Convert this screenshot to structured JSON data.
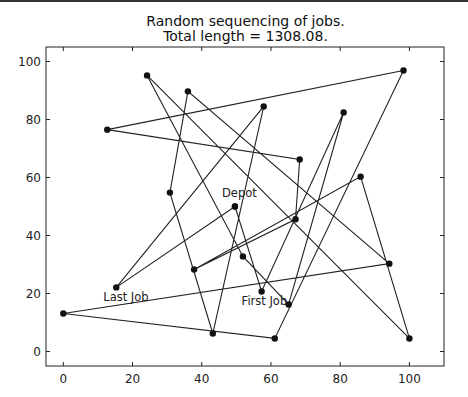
{
  "chart_data": {
    "type": "line",
    "title": "Random sequencing of jobs.",
    "subtitle": "Total length = 1308.08.",
    "xlabel": "",
    "ylabel": "",
    "xlim": [
      -5,
      110
    ],
    "ylim": [
      -5,
      105
    ],
    "xticks": [
      0,
      20,
      40,
      60,
      80,
      100
    ],
    "yticks": [
      0,
      20,
      40,
      60,
      80,
      100
    ],
    "grid": false,
    "legend": null,
    "marker": "circle",
    "line_color": "#222222",
    "points": [
      {
        "id": "depot",
        "x": 49.6,
        "y": 50.0,
        "label": "Depot"
      },
      {
        "id": "first",
        "x": 57.3,
        "y": 20.7,
        "label": "First Job"
      },
      {
        "x": 81.0,
        "y": 82.4
      },
      {
        "x": 65.1,
        "y": 16.2
      },
      {
        "x": 51.9,
        "y": 32.8
      },
      {
        "x": 24.2,
        "y": 95.2
      },
      {
        "x": 100.0,
        "y": 4.5
      },
      {
        "x": 85.9,
        "y": 60.3
      },
      {
        "x": 37.8,
        "y": 28.3
      },
      {
        "x": 67.1,
        "y": 45.6
      },
      {
        "x": 68.3,
        "y": 66.2
      },
      {
        "x": 12.7,
        "y": 76.5
      },
      {
        "x": 98.3,
        "y": 96.9
      },
      {
        "x": 61.1,
        "y": 4.5
      },
      {
        "x": 0.0,
        "y": 13.1
      },
      {
        "x": 94.2,
        "y": 30.3
      },
      {
        "x": 36.0,
        "y": 89.7
      },
      {
        "x": 30.8,
        "y": 54.8
      },
      {
        "x": 43.2,
        "y": 6.2
      },
      {
        "x": 57.9,
        "y": 84.5
      },
      {
        "id": "last",
        "x": 15.3,
        "y": 22.1,
        "label": "Last Job"
      },
      {
        "id": "depot_return",
        "x": 49.6,
        "y": 50.0
      }
    ],
    "annotations": [
      {
        "text": "Depot",
        "x": 49.6,
        "y": 50.0
      },
      {
        "text": "First Job",
        "x": 57.3,
        "y": 20.7
      },
      {
        "text": "Last Job",
        "x": 15.3,
        "y": 22.1
      }
    ]
  }
}
